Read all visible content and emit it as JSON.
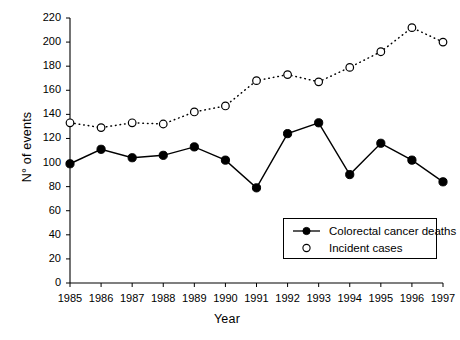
{
  "chart_data": {
    "type": "line",
    "title": "",
    "subtitle": "",
    "xlabel": "Year",
    "ylabel": "N° of events",
    "x": [
      1985,
      1986,
      1987,
      1988,
      1989,
      1990,
      1991,
      1992,
      1993,
      1994,
      1995,
      1996,
      1997
    ],
    "categories": [
      "1985",
      "1986",
      "1987",
      "1988",
      "1989",
      "1990",
      "1991",
      "1992",
      "1993",
      "1994",
      "1995",
      "1996",
      "1997"
    ],
    "series": [
      {
        "name": "Colorectal cancer deaths",
        "marker": "filled-circle",
        "linestyle": "solid",
        "color": "#000000",
        "values": [
          99,
          111,
          104,
          106,
          113,
          102,
          79,
          124,
          133,
          90,
          116,
          102,
          84
        ]
      },
      {
        "name": "Incident cases",
        "marker": "open-circle",
        "linestyle": "dotted",
        "color": "#000000",
        "values": [
          133,
          129,
          133,
          132,
          142,
          147,
          168,
          173,
          167,
          179,
          192,
          212,
          200
        ]
      }
    ],
    "ylim": [
      0,
      220
    ],
    "yticks": [
      0,
      20,
      40,
      60,
      80,
      100,
      120,
      140,
      160,
      180,
      200,
      220
    ],
    "ytick_labels": [
      "0",
      "20",
      "40",
      "60",
      "80",
      "100",
      "120",
      "140",
      "160",
      "180",
      "200",
      "220"
    ],
    "xlim": [
      1985,
      1997
    ],
    "xticks": [
      1985,
      1986,
      1987,
      1988,
      1989,
      1990,
      1991,
      1992,
      1993,
      1994,
      1995,
      1996,
      1997
    ],
    "grid": false,
    "legend_position": "inside-lower-right",
    "legend": [
      "Colorectal cancer deaths",
      "Incident cases"
    ],
    "annotations": []
  },
  "legend": {
    "entries": [
      {
        "label": "Colorectal cancer deaths",
        "marker": "filled-circle"
      },
      {
        "label": "Incident cases",
        "marker": "open-circle"
      }
    ]
  }
}
